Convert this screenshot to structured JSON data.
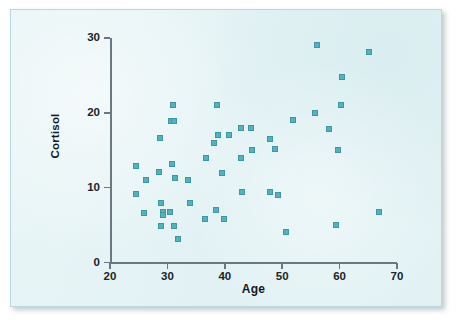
{
  "figure": {
    "background_color": "#e2f2f4",
    "border_color": "#bcd8dc",
    "point_color": "#53b2bd",
    "axis_color": "#6a7880"
  },
  "chart_data": {
    "type": "scatter",
    "title": "",
    "xlabel": "Age",
    "ylabel": "Cortisol",
    "xlim": [
      20,
      70
    ],
    "ylim": [
      0,
      30
    ],
    "xticks": [
      20,
      30,
      40,
      50,
      60,
      70
    ],
    "yticks": [
      0,
      10,
      20,
      30
    ],
    "xtick_labels": [
      "20",
      "30",
      "40",
      "50",
      "60",
      "70"
    ],
    "ytick_labels": [
      "0",
      "10",
      "20",
      "30"
    ],
    "grid": false,
    "legend": false,
    "marker": "square",
    "series": [
      {
        "name": "Subjects",
        "points": [
          [
            24.6,
            12.9
          ],
          [
            24.5,
            9.1
          ],
          [
            26.3,
            11.0
          ],
          [
            26.0,
            6.6
          ],
          [
            28.7,
            16.7
          ],
          [
            28.6,
            12.1
          ],
          [
            28.8,
            7.9
          ],
          [
            29.3,
            6.8
          ],
          [
            29.2,
            6.4
          ],
          [
            28.8,
            4.9
          ],
          [
            30.4,
            6.8
          ],
          [
            31.0,
            21.0
          ],
          [
            30.6,
            18.9
          ],
          [
            31.2,
            18.9
          ],
          [
            30.8,
            13.2
          ],
          [
            31.3,
            11.3
          ],
          [
            31.1,
            4.9
          ],
          [
            31.9,
            3.1
          ],
          [
            33.6,
            11.0
          ],
          [
            34.0,
            8.0
          ],
          [
            36.8,
            14.0
          ],
          [
            36.6,
            5.8
          ],
          [
            38.2,
            16.0
          ],
          [
            38.7,
            21.0
          ],
          [
            38.8,
            17.0
          ],
          [
            38.5,
            7.0
          ],
          [
            39.5,
            12.0
          ],
          [
            39.8,
            5.8
          ],
          [
            40.8,
            17.0
          ],
          [
            42.8,
            18.0
          ],
          [
            42.9,
            14.0
          ],
          [
            43.0,
            9.4
          ],
          [
            44.6,
            18.0
          ],
          [
            44.7,
            15.0
          ],
          [
            47.8,
            16.5
          ],
          [
            47.9,
            9.4
          ],
          [
            48.7,
            15.2
          ],
          [
            49.2,
            9.0
          ],
          [
            50.7,
            4.1
          ],
          [
            51.8,
            19.0
          ],
          [
            55.8,
            20.0
          ],
          [
            56.0,
            29.0
          ],
          [
            58.2,
            17.8
          ],
          [
            59.3,
            5.0
          ],
          [
            59.8,
            15.1
          ],
          [
            60.2,
            21.0
          ],
          [
            60.5,
            24.8
          ],
          [
            65.1,
            28.1
          ],
          [
            66.8,
            6.7
          ]
        ]
      }
    ]
  }
}
